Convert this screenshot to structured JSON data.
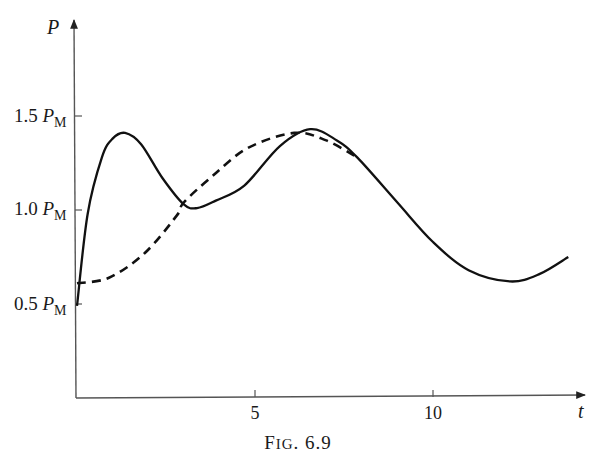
{
  "figure": {
    "caption_prefix": "F",
    "caption_smallcaps": "IG",
    "caption_number": ". 6.9"
  },
  "axes": {
    "y_title": "P",
    "x_title": "t",
    "y_ticks": [
      {
        "coef": "1.5 ",
        "sym": "P",
        "sub": "M",
        "value": 1.5
      },
      {
        "coef": "1.0 ",
        "sym": "P",
        "sub": "M",
        "value": 1.0
      },
      {
        "coef": "0.5 ",
        "sym": "P",
        "sub": "M",
        "value": 0.5
      }
    ],
    "x_ticks": [
      {
        "label": "5",
        "value": 5
      },
      {
        "label": "10",
        "value": 10
      }
    ]
  },
  "colors": {
    "curve": "#111111",
    "axis": "#555555"
  },
  "chart_data": {
    "type": "line",
    "title": "Fig. 6.9",
    "xlabel": "t",
    "ylabel": "P (in units of P_M)",
    "xlim": [
      0,
      14.2
    ],
    "ylim": [
      0,
      2.0
    ],
    "y_tick_labels": [
      "1.5 P_M",
      "1.0 P_M",
      "0.5 P_M"
    ],
    "x_tick_labels": [
      "5",
      "10"
    ],
    "grid": false,
    "legend": null,
    "series": [
      {
        "name": "solid",
        "style": "solid",
        "x": [
          0,
          0.3,
          0.7,
          1.0,
          1.35,
          1.8,
          2.4,
          3.0,
          3.37,
          3.9,
          4.7,
          5.7,
          6.55,
          7.3,
          7.87,
          9.0,
          10.0,
          11.0,
          12.16,
          13.0,
          13.8
        ],
        "y": [
          0.49,
          0.98,
          1.28,
          1.38,
          1.41,
          1.35,
          1.17,
          1.03,
          1.01,
          1.05,
          1.13,
          1.34,
          1.43,
          1.37,
          1.28,
          1.04,
          0.83,
          0.68,
          0.62,
          0.66,
          0.75
        ]
      },
      {
        "name": "dashed",
        "style": "dashed",
        "x": [
          0,
          0.9,
          1.9,
          2.8,
          3.0,
          3.8,
          4.8,
          6.1,
          7.0,
          7.87
        ],
        "y": [
          0.61,
          0.64,
          0.77,
          0.97,
          1.04,
          1.18,
          1.33,
          1.41,
          1.37,
          1.28
        ]
      }
    ],
    "annotations": [
      "solid and dashed curves merge near t≈7.9"
    ]
  }
}
